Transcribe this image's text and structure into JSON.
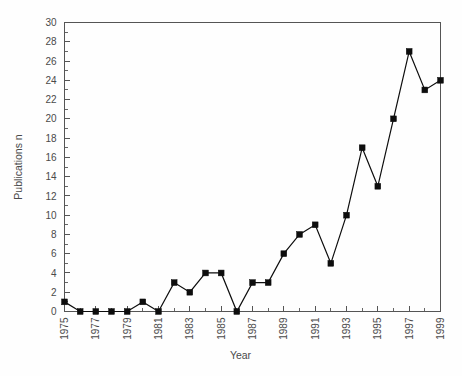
{
  "chart_data": {
    "type": "line",
    "title": "",
    "subtitle": "",
    "xlabel": "Year",
    "ylabel": "Publications n",
    "x": [
      1975,
      1976,
      1977,
      1978,
      1979,
      1980,
      1981,
      1982,
      1983,
      1984,
      1985,
      1986,
      1987,
      1988,
      1989,
      1990,
      1991,
      1992,
      1993,
      1994,
      1995,
      1996,
      1997,
      1998,
      1999
    ],
    "values": [
      1,
      0,
      0,
      0,
      0,
      1,
      0,
      3,
      2,
      4,
      4,
      0,
      3,
      3,
      6,
      8,
      9,
      5,
      10,
      17,
      13,
      20,
      27,
      23,
      24
    ],
    "series": [
      {
        "name": "Publications",
        "values": [
          1,
          0,
          0,
          0,
          0,
          1,
          0,
          3,
          2,
          4,
          4,
          0,
          3,
          3,
          6,
          8,
          9,
          5,
          10,
          17,
          13,
          20,
          27,
          23,
          24
        ],
        "marker": "filled-square",
        "color": "#0d0d0d"
      }
    ],
    "xlim": [
      1975,
      1999
    ],
    "ylim": [
      0,
      30
    ],
    "ytick_step": 2,
    "yticks": [
      0,
      2,
      4,
      6,
      8,
      10,
      12,
      14,
      16,
      18,
      20,
      22,
      24,
      26,
      28,
      30
    ],
    "ytick_labels": [
      "0",
      "2",
      "4",
      "6",
      "8",
      "10",
      "12",
      "14",
      "16",
      "18",
      "20",
      "22",
      "24",
      "26",
      "28",
      "30"
    ],
    "y_minor_ticks": [
      1,
      3,
      5,
      7,
      9,
      11,
      13,
      15,
      17,
      19,
      21,
      23,
      25,
      27,
      29
    ],
    "xticks": [
      1975,
      1976,
      1977,
      1978,
      1979,
      1980,
      1981,
      1982,
      1983,
      1984,
      1985,
      1986,
      1987,
      1988,
      1989,
      1990,
      1991,
      1992,
      1993,
      1994,
      1995,
      1996,
      1997,
      1998,
      1999
    ],
    "xtick_labels_shown": [
      "1975",
      "1977",
      "1979",
      "1981",
      "1983",
      "1985",
      "1987",
      "1989",
      "1991",
      "1993",
      "1995",
      "1997",
      "1999"
    ],
    "xtick_label_rotation": -90,
    "grid": false,
    "legend": false,
    "legend_position": "none",
    "plot_box": "full",
    "colors": {
      "line": "#0d0d0d",
      "marker": "#0d0d0d",
      "axis": "#555555",
      "text": "#4a4a4a",
      "background": "#fefefe"
    }
  }
}
